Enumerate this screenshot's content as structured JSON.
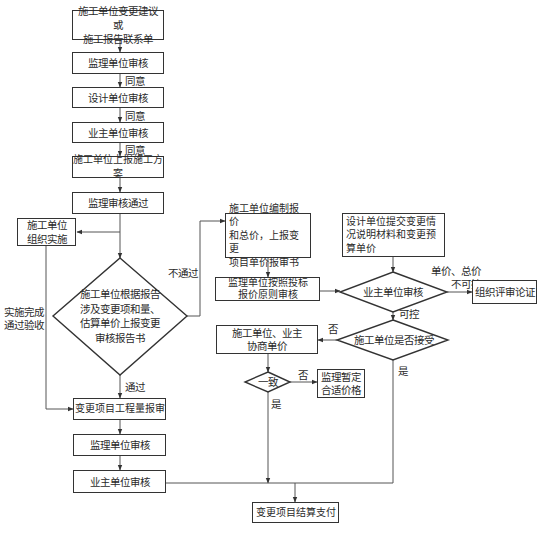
{
  "flowchart": {
    "left_column": {
      "b1": "施工单位变更建议或\n施工报告联系单",
      "b2": "监理单位审核",
      "b3": "设计单位审核",
      "b4": "业主单位审核",
      "b5": "施工单位上报施工方案",
      "b6": "监理审核通过",
      "agree1": "同意",
      "agree2": "同意",
      "agree3": "同意",
      "impl_box": "施工单位\n组织实施",
      "impl_done": "实施完成\n通过验收",
      "decision": "施工单位根据报告\n涉及变更项和量、\n估算单价上报变更\n审核报告书",
      "pass": "通过",
      "fail": "不通过",
      "b7": "变更项目工程量报审",
      "b8": "监理单位审核",
      "b9": "业主单位审核"
    },
    "middle_column": {
      "price_box": "施工单位编制报价\n和总价，上报变更\n项目单价报审书",
      "supervisor_box": "监理单位按照投标\n报价原则审核",
      "negotiate_box": "施工单位、业主\n协商单价",
      "agree_decision": "一致",
      "no1": "否",
      "yes1": "是",
      "temp_price_box": "监理暂定\n合适价格"
    },
    "right_column": {
      "design_box": "设计单位提交变更情\n况说明材料和变更预\n算单价",
      "owner_decision": "业主单位审核",
      "uncontrollable": "单价、总价\n不可控",
      "review_box": "组织评审论证",
      "controllable": "可控",
      "accept_decision": "施工单位是否接受",
      "no2": "否",
      "yes2": "是"
    },
    "final_box": "变更项目结算支付"
  }
}
